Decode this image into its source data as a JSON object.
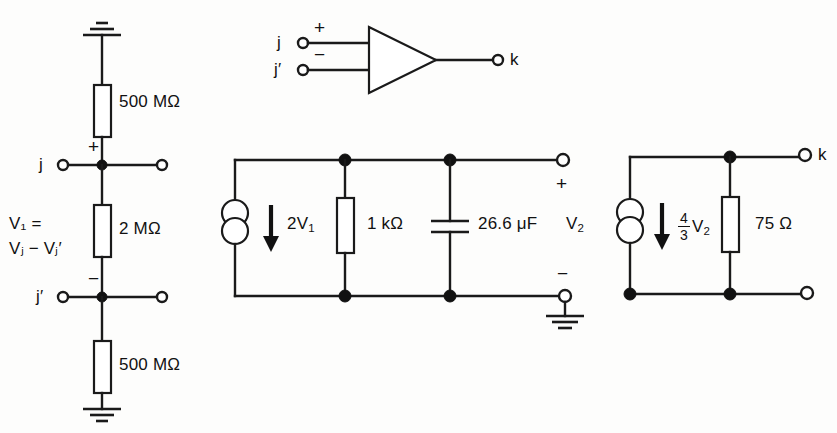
{
  "diagram": {
    "ink_color": "#1a1a1a",
    "background_color": "#fdfdfc"
  },
  "amplifier": {
    "input_plus_terminal": "j",
    "input_plus_sign": "+",
    "input_minus_terminal": "j′",
    "input_minus_sign": "−",
    "output_terminal": "k",
    "symbol": "triangle-amplifier"
  },
  "input_network": {
    "top_resistor_value": "500 MΩ",
    "middle_resistor_value": "2 MΩ",
    "bottom_resistor_value": "500 MΩ",
    "node_plus_label": "j",
    "node_plus_sign": "+",
    "node_minus_label": "j′",
    "node_minus_sign": "−",
    "voltage_definition_line1": "V₁ =",
    "voltage_definition_line2": "Vⱼ − Vⱼ′",
    "voltage_name": "V",
    "voltage_subscript": "1"
  },
  "stage_one": {
    "source_label_prefix": "2V",
    "source_label_subscript": "1",
    "source_symbol": "dependent-current-source",
    "source_direction": "down",
    "resistor_value": "1 kΩ",
    "capacitor_value": "26.6 μF",
    "output_voltage_name": "V",
    "output_voltage_subscript": "2",
    "output_plus_sign": "+",
    "output_minus_sign": "−",
    "ground_symbol": "earth-ground"
  },
  "stage_two": {
    "source_fraction_numerator": "4",
    "source_fraction_denominator": "3",
    "source_label_suffix": "V",
    "source_label_subscript": "2",
    "source_symbol": "dependent-current-source",
    "source_direction": "down",
    "resistor_value": "75 Ω",
    "output_terminal": "k"
  }
}
